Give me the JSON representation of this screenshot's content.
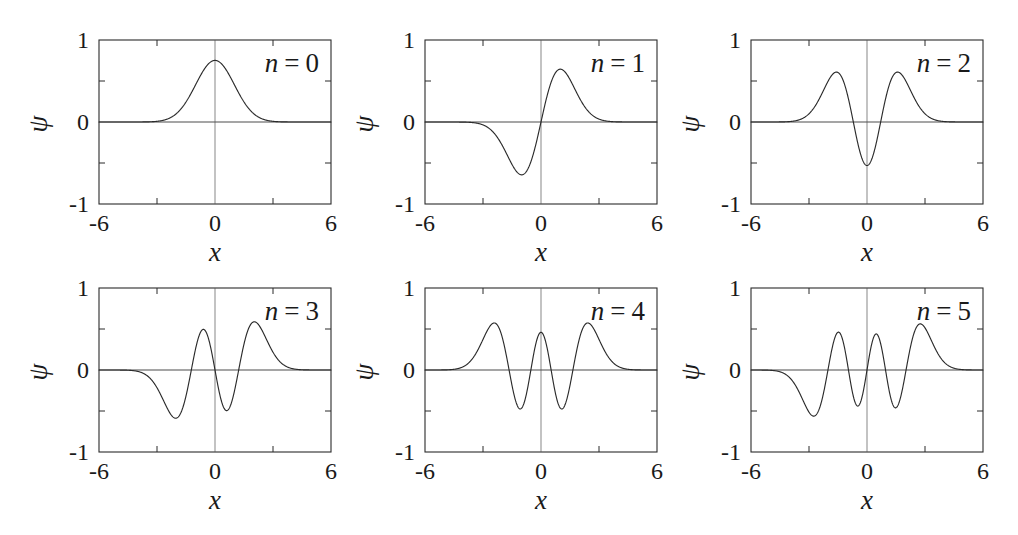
{
  "figure": {
    "background": "#ffffff",
    "ink_color": "#2b2b2b",
    "rows": 2,
    "cols": 3,
    "panel_count": 6
  },
  "axis": {
    "xlabel": "x",
    "ylabel": "ψ",
    "xticklabels": [
      "-6",
      "0",
      "6"
    ],
    "yticklabels": [
      "1",
      "0",
      "-1"
    ],
    "xlim": [
      -6,
      6
    ],
    "ylim": [
      -1,
      1
    ],
    "xticks": [
      -6,
      0,
      6
    ],
    "yticks": [
      1,
      0,
      -1
    ],
    "minor_xticks": [
      -3,
      3
    ],
    "minor_yticks": [
      0.5,
      -0.5
    ],
    "grid": false,
    "legend": "none"
  },
  "panels": [
    {
      "label_prefix": "n",
      "label_eq": "=",
      "label_value": "0",
      "n": 0
    },
    {
      "label_prefix": "n",
      "label_eq": "=",
      "label_value": "1",
      "n": 1
    },
    {
      "label_prefix": "n",
      "label_eq": "=",
      "label_value": "2",
      "n": 2
    },
    {
      "label_prefix": "n",
      "label_eq": "=",
      "label_value": "3",
      "n": 3
    },
    {
      "label_prefix": "n",
      "label_eq": "=",
      "label_value": "4",
      "n": 4
    },
    {
      "label_prefix": "n",
      "label_eq": "=",
      "label_value": "5",
      "n": 5
    }
  ],
  "chart_data": {
    "type": "line",
    "title": "",
    "xlabel": "x",
    "ylabel": "ψ",
    "xlim": [
      -6,
      6
    ],
    "ylim": [
      -1,
      1
    ],
    "grid": false,
    "legend_position": "inside-top-right",
    "formula": "psi_n(x) = (1/sqrt(2^n n! sqrt(pi))) * H_n(x) * exp(-x^2/2)",
    "series": [
      {
        "name": "n = 0",
        "n": 0,
        "parity": "even",
        "nodes": 0,
        "peak_value": 0.751,
        "peak_x": 0.0,
        "extrema": [
          {
            "x": 0.0,
            "y": 0.751
          }
        ],
        "x": [
          -6,
          -5.5,
          -5,
          -4.5,
          -4,
          -3.5,
          -3,
          -2.5,
          -2,
          -1.5,
          -1,
          -0.5,
          0,
          0.5,
          1,
          1.5,
          2,
          2.5,
          3,
          3.5,
          4,
          4.5,
          5,
          5.5,
          6
        ],
        "y": [
          0.0,
          0.0,
          0.0,
          0.0,
          0.0,
          0.002,
          0.008,
          0.032,
          0.102,
          0.244,
          0.456,
          0.663,
          0.751,
          0.663,
          0.456,
          0.244,
          0.102,
          0.032,
          0.008,
          0.002,
          0.0,
          0.0,
          0.0,
          0.0,
          0.0
        ]
      },
      {
        "name": "n = 1",
        "n": 1,
        "parity": "odd",
        "nodes": 1,
        "peak_value": 0.644,
        "peak_x": 1.0,
        "extrema": [
          {
            "x": -1.0,
            "y": -0.644
          },
          {
            "x": 1.0,
            "y": 0.644
          }
        ],
        "x": [
          -6,
          -5.5,
          -5,
          -4.5,
          -4,
          -3.5,
          -3,
          -2.5,
          -2,
          -1.5,
          -1,
          -0.5,
          0,
          0.5,
          1,
          1.5,
          2,
          2.5,
          3,
          3.5,
          4,
          4.5,
          5,
          5.5,
          6
        ],
        "y": [
          0.0,
          0.0,
          0.0,
          0.0,
          -0.001,
          -0.008,
          -0.032,
          -0.112,
          -0.289,
          -0.517,
          -0.644,
          -0.469,
          0.0,
          0.469,
          0.644,
          0.517,
          0.289,
          0.112,
          0.032,
          0.008,
          0.001,
          0.0,
          0.0,
          0.0,
          0.0
        ]
      },
      {
        "name": "n = 2",
        "n": 2,
        "parity": "even",
        "nodes": 2,
        "peak_value": 0.604,
        "peak_x": 1.732,
        "extrema": [
          {
            "x": -1.732,
            "y": 0.604
          },
          {
            "x": 0.0,
            "y": -0.531
          },
          {
            "x": 1.732,
            "y": 0.604
          }
        ],
        "x": [
          -6,
          -5.5,
          -5,
          -4.5,
          -4,
          -3.5,
          -3,
          -2.5,
          -2,
          -1.5,
          -1,
          -0.5,
          0,
          0.5,
          1,
          1.5,
          2,
          2.5,
          3,
          3.5,
          4,
          4.5,
          5,
          5.5,
          6
        ],
        "y": [
          0.0,
          0.0,
          0.0,
          0.0,
          0.004,
          0.023,
          0.084,
          0.226,
          0.432,
          0.575,
          0.483,
          0.086,
          -0.531,
          0.086,
          0.483,
          0.575,
          0.432,
          0.226,
          0.084,
          0.023,
          0.004,
          0.0,
          0.0,
          0.0,
          0.0
        ]
      },
      {
        "name": "n = 3",
        "n": 3,
        "parity": "odd",
        "nodes": 3,
        "peak_value": 0.566,
        "peak_x": 2.335,
        "extrema": [
          {
            "x": -2.335,
            "y": -0.566
          },
          {
            "x": -0.686,
            "y": 0.51
          },
          {
            "x": 0.686,
            "y": -0.51
          },
          {
            "x": 2.335,
            "y": 0.566
          }
        ],
        "x": [
          -6,
          -5.5,
          -5,
          -4.5,
          -4,
          -3.5,
          -3,
          -2.5,
          -2,
          -1.5,
          -1,
          -0.5,
          0,
          0.5,
          1,
          1.5,
          2,
          2.5,
          3,
          3.5,
          4,
          4.5,
          5,
          5.5,
          6
        ],
        "y": [
          0.0,
          0.0,
          0.0,
          -0.002,
          -0.014,
          -0.065,
          -0.2,
          -0.421,
          -0.553,
          -0.407,
          0.03,
          0.42,
          0.0,
          -0.42,
          -0.03,
          0.407,
          0.553,
          0.421,
          0.2,
          0.065,
          0.014,
          0.002,
          0.0,
          0.0,
          0.0
        ]
      },
      {
        "name": "n = 4",
        "n": 4,
        "parity": "even",
        "nodes": 4,
        "peak_value": 0.548,
        "peak_x": 2.857,
        "extrema": [
          {
            "x": -2.857,
            "y": 0.548
          },
          {
            "x": -1.356,
            "y": -0.494
          },
          {
            "x": 0.0,
            "y": 0.452
          },
          {
            "x": 1.356,
            "y": -0.494
          },
          {
            "x": 2.857,
            "y": 0.548
          }
        ],
        "x": [
          -6,
          -5.5,
          -5,
          -4.5,
          -4,
          -3.5,
          -3,
          -2.5,
          -2,
          -1.5,
          -1,
          -0.5,
          0,
          0.5,
          1,
          1.5,
          2,
          2.5,
          3,
          3.5,
          4,
          4.5,
          5,
          5.5,
          6
        ],
        "y": [
          0.0,
          0.0,
          0.001,
          0.008,
          0.042,
          0.162,
          0.394,
          0.528,
          0.328,
          -0.265,
          -0.488,
          -0.033,
          0.452,
          -0.033,
          -0.488,
          -0.265,
          0.328,
          0.528,
          0.394,
          0.162,
          0.042,
          0.008,
          0.001,
          0.0,
          0.0
        ]
      },
      {
        "name": "n = 5",
        "n": 5,
        "parity": "odd",
        "nodes": 5,
        "peak_value": 0.534,
        "peak_x": 3.325,
        "extrema": [
          {
            "x": -3.325,
            "y": -0.534
          },
          {
            "x": -1.89,
            "y": 0.487
          },
          {
            "x": -0.617,
            "y": -0.455
          },
          {
            "x": 0.617,
            "y": 0.455
          },
          {
            "x": 1.89,
            "y": -0.487
          },
          {
            "x": 3.325,
            "y": 0.534
          }
        ],
        "x": [
          -6,
          -5.5,
          -5,
          -4.5,
          -4,
          -3.5,
          -3,
          -2.5,
          -2,
          -1.5,
          -1,
          -0.5,
          0,
          0.5,
          1,
          1.5,
          2,
          2.5,
          3,
          3.5,
          4,
          4.5,
          5,
          5.5,
          6
        ],
        "y": [
          0.0,
          -0.001,
          -0.004,
          -0.025,
          -0.112,
          -0.326,
          -0.519,
          -0.431,
          0.038,
          0.454,
          0.325,
          -0.381,
          0.0,
          0.381,
          -0.325,
          -0.454,
          -0.038,
          0.431,
          0.519,
          0.326,
          0.112,
          0.025,
          0.004,
          0.001,
          0.0
        ]
      }
    ]
  }
}
